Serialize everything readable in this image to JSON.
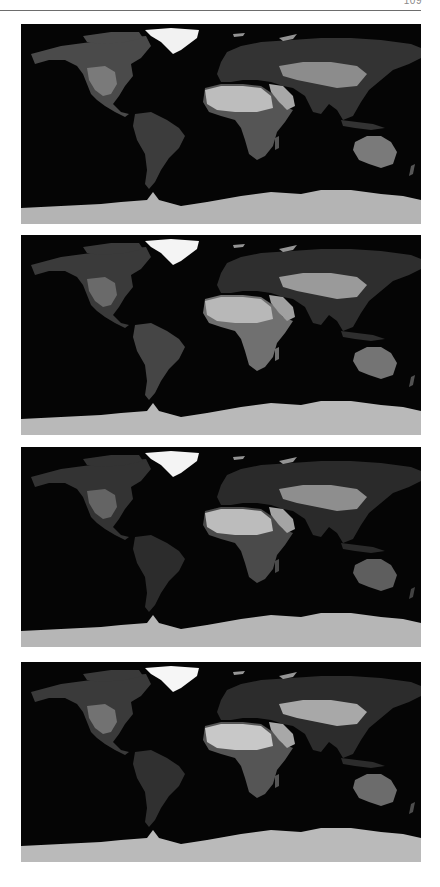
{
  "page": {
    "page_number": "109",
    "header_rule": true
  },
  "figure": {
    "type": "stacked global grayscale maps",
    "projection": "equirectangular",
    "panel_count": 4,
    "panels": [
      {
        "index": 1,
        "top": 24,
        "label": "",
        "brightness": {
          "greenland": "#f2f2f2",
          "n_america": "#4a4a4a",
          "sw_us": "#7a7a7a",
          "s_america": "#3c3c3c",
          "sahara": "#bdbdbd",
          "arabia": "#a8a8a8",
          "s_africa": "#555555",
          "eurasia": "#333333",
          "c_asia": "#8c8c8c",
          "australia": "#7a7a7a",
          "antarctica": "#b4b4b4"
        }
      },
      {
        "index": 2,
        "top": 235,
        "label": "",
        "brightness": {
          "greenland": "#f4f4f4",
          "n_america": "#3a3a3a",
          "sw_us": "#6a6a6a",
          "s_america": "#454545",
          "sahara": "#b8b8b8",
          "arabia": "#a0a0a0",
          "s_africa": "#707070",
          "eurasia": "#2e2e2e",
          "c_asia": "#9a9a9a",
          "australia": "#747474",
          "antarctica": "#b9b9b9"
        }
      },
      {
        "index": 3,
        "top": 447,
        "label": "",
        "brightness": {
          "greenland": "#f4f4f4",
          "n_america": "#333333",
          "sw_us": "#646464",
          "s_america": "#2c2c2c",
          "sahara": "#bcbcbc",
          "arabia": "#a4a4a4",
          "s_africa": "#4a4a4a",
          "eurasia": "#2a2a2a",
          "c_asia": "#8e8e8e",
          "australia": "#5e5e5e",
          "antarctica": "#b6b6b6"
        }
      },
      {
        "index": 4,
        "top": 662,
        "label": "",
        "brightness": {
          "greenland": "#f6f6f6",
          "n_america": "#3a3a3a",
          "sw_us": "#727272",
          "s_america": "#303030",
          "sahara": "#c8c8c8",
          "arabia": "#a8a8a8",
          "s_africa": "#555555",
          "eurasia": "#2c2c2c",
          "c_asia": "#a8a8a8",
          "australia": "#6c6c6c",
          "antarctica": "#bababa"
        }
      }
    ]
  }
}
